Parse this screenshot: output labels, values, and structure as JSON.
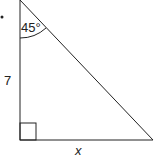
{
  "diagram": {
    "type": "right-triangle",
    "angle_label": "45°",
    "side_vertical_label": "7",
    "side_horizontal_label": "x",
    "right_angle_marker": true,
    "colors": {
      "stroke": "#222222",
      "background": "#ffffff"
    }
  }
}
